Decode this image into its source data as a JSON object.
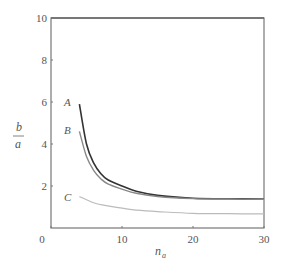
{
  "chart_data": {
    "type": "line",
    "title": "",
    "xlabel": "n_a",
    "ylabel": "b/a",
    "xlim": [
      0,
      30
    ],
    "ylim": [
      0,
      10
    ],
    "xticks": [
      0,
      10,
      20,
      30
    ],
    "yticks": [
      2,
      4,
      6,
      8,
      10
    ],
    "xtick_labels": [
      "0",
      "10",
      "20",
      "30"
    ],
    "ytick_labels": [
      "2",
      "4",
      "6",
      "8",
      "10"
    ],
    "grid": false,
    "legend": "inline curve labels at left start of each curve",
    "series": [
      {
        "name": "A",
        "color": "#333333",
        "x": [
          4,
          5,
          6,
          7,
          8,
          10,
          12,
          15,
          20,
          25,
          30
        ],
        "y": [
          5.9,
          4.0,
          3.1,
          2.6,
          2.3,
          2.0,
          1.75,
          1.55,
          1.42,
          1.39,
          1.38
        ]
      },
      {
        "name": "B",
        "color": "#888888",
        "x": [
          4,
          5,
          6,
          7,
          8,
          10,
          12,
          15,
          20,
          25,
          30
        ],
        "y": [
          4.6,
          3.4,
          2.75,
          2.35,
          2.1,
          1.85,
          1.65,
          1.5,
          1.4,
          1.38,
          1.37
        ]
      },
      {
        "name": "C",
        "color": "#bbbbbb",
        "x": [
          4,
          6,
          8,
          10,
          12,
          15,
          20,
          25,
          30
        ],
        "y": [
          1.5,
          1.2,
          1.05,
          0.95,
          0.85,
          0.78,
          0.7,
          0.68,
          0.67
        ]
      }
    ]
  },
  "labels": {
    "y_num": "b",
    "y_den": "a",
    "x_main": "n",
    "x_sub": "a",
    "curve_a": "A",
    "curve_b": "B",
    "curve_c": "C"
  }
}
